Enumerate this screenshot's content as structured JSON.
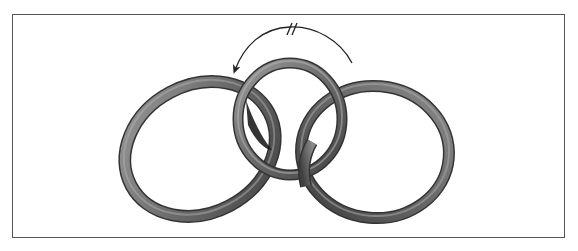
{
  "figure": {
    "frame_color": "#555555",
    "background": "#ffffff",
    "ring_color": "#6e6e6e",
    "ring_highlight": "#b8b8b8",
    "ring_shadow": "#2a2a2a"
  },
  "rings": [
    {
      "id": "left",
      "cx": 200,
      "cy": 149,
      "rx": 78,
      "ry": 64,
      "rotate": -28,
      "stroke": 12
    },
    {
      "id": "middle",
      "cx": 290,
      "cy": 119,
      "rx": 52,
      "ry": 56,
      "rotate": 0,
      "stroke": 10
    },
    {
      "id": "right",
      "cx": 375,
      "cy": 152,
      "rx": 74,
      "ry": 66,
      "rotate": 5,
      "stroke": 11
    }
  ],
  "arrow": {
    "direction": "counter-clockwise",
    "start": [
      352,
      63
    ],
    "end": [
      233,
      74
    ],
    "mark": "//",
    "mark_position": [
      292,
      29
    ]
  }
}
